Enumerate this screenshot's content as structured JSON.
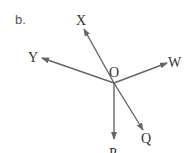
{
  "part_label": "b.",
  "center": {
    "label": "O",
    "x": 114,
    "y": 83
  },
  "rays": [
    {
      "label": "X",
      "x2": 84,
      "y2": 29,
      "lx": 78,
      "ly": 25
    },
    {
      "label": "Y",
      "x2": 42,
      "y2": 58,
      "lx": 29,
      "ly": 62
    },
    {
      "label": "W",
      "x2": 167,
      "y2": 63,
      "lx": 170,
      "ly": 68
    },
    {
      "label": "Q",
      "x2": 143,
      "y2": 130,
      "lx": 143,
      "ly": 144
    },
    {
      "label": "P",
      "x2": 114,
      "y2": 139,
      "lx": 110,
      "ly": 155
    }
  ],
  "colors": {
    "line": "#666666",
    "text": "#333333"
  }
}
